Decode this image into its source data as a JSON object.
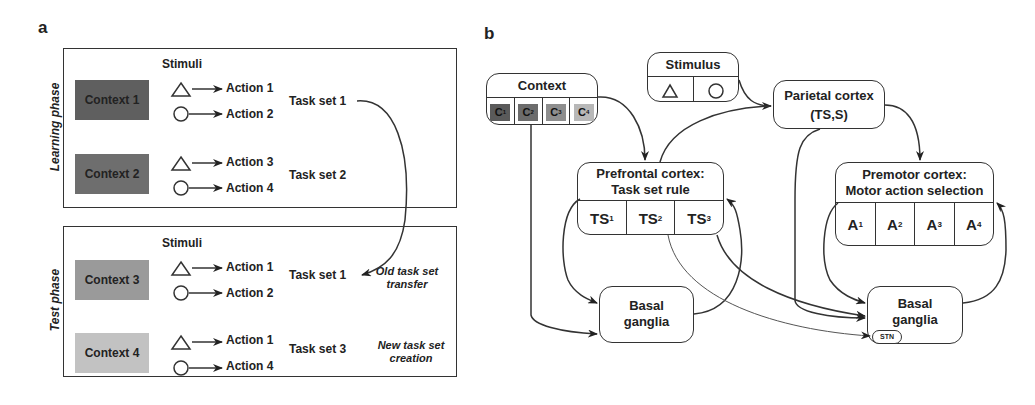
{
  "panel_a": {
    "label": "a",
    "learning_phase": {
      "label": "Learning phase",
      "stimuli_header": "Stimuli",
      "contexts": [
        {
          "label": "Context 1",
          "color": "#5f5f5f",
          "rows": [
            {
              "stimulus": "triangle",
              "action": "Action 1"
            },
            {
              "stimulus": "circle",
              "action": "Action 2"
            }
          ],
          "task_set": "Task set 1"
        },
        {
          "label": "Context 2",
          "color": "#6e6e6e",
          "rows": [
            {
              "stimulus": "triangle",
              "action": "Action 3"
            },
            {
              "stimulus": "circle",
              "action": "Action 4"
            }
          ],
          "task_set": "Task set 2"
        }
      ]
    },
    "test_phase": {
      "label": "Test phase",
      "stimuli_header": "Stimuli",
      "contexts": [
        {
          "label": "Context 3",
          "color": "#9a9a9a",
          "rows": [
            {
              "stimulus": "triangle",
              "action": "Action 1"
            },
            {
              "stimulus": "circle",
              "action": "Action 2"
            }
          ],
          "task_set": "Task set 1",
          "note": "Old task set transfer"
        },
        {
          "label": "Context 4",
          "color": "#c2c2c2",
          "rows": [
            {
              "stimulus": "triangle",
              "action": "Action 1"
            },
            {
              "stimulus": "circle",
              "action": "Action 4"
            }
          ],
          "task_set": "Task set 3",
          "note": "New task set creation"
        }
      ]
    }
  },
  "panel_b": {
    "label": "b",
    "context_node": {
      "title": "Context",
      "cells": [
        {
          "base": "C",
          "sub": "1",
          "color": "#5a5a5a"
        },
        {
          "base": "C",
          "sub": "2",
          "color": "#6c6c6c"
        },
        {
          "base": "C",
          "sub": "3",
          "color": "#8e8e8e"
        },
        {
          "base": "C",
          "sub": "4",
          "color": "#b8b8b8"
        }
      ]
    },
    "stimulus_node": {
      "title": "Stimulus",
      "cells": [
        "triangle",
        "circle"
      ]
    },
    "parietal_node": {
      "title": "Parietal cortex",
      "subtitle": "(TS,S)"
    },
    "prefrontal_node": {
      "title_line1": "Prefrontal cortex:",
      "title_line2": "Task set rule",
      "cells": [
        {
          "base": "TS",
          "sub": "1"
        },
        {
          "base": "TS",
          "sub": "2"
        },
        {
          "base": "TS",
          "sub": "3"
        }
      ]
    },
    "premotor_node": {
      "title_line1": "Premotor cortex:",
      "title_line2": "Motor action selection",
      "cells": [
        {
          "base": "A",
          "sub": "1"
        },
        {
          "base": "A",
          "sub": "2"
        },
        {
          "base": "A",
          "sub": "3"
        },
        {
          "base": "A",
          "sub": "4"
        }
      ]
    },
    "basal_ganglia_left": {
      "line1": "Basal",
      "line2": "ganglia"
    },
    "basal_ganglia_right": {
      "line1": "Basal",
      "line2": "ganglia",
      "stn": "STN"
    }
  }
}
